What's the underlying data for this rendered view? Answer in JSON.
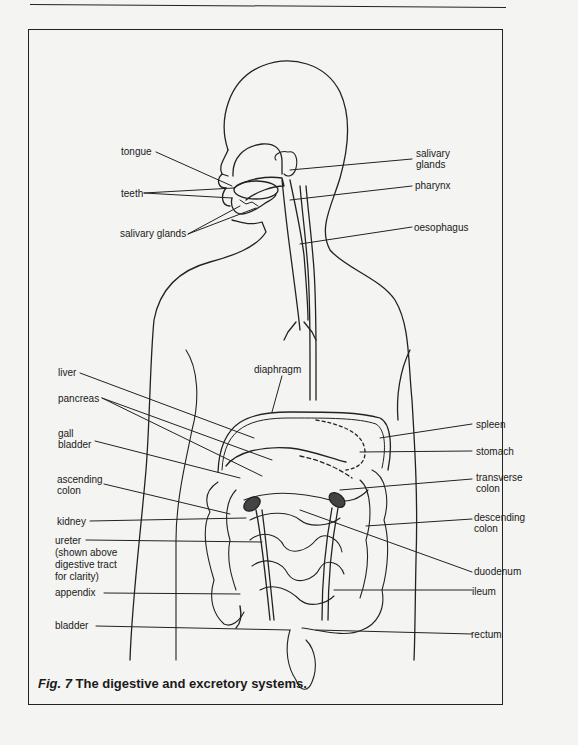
{
  "figure": {
    "caption_prefix": "Fig. 7",
    "caption_text": " The digestive and excretory systems."
  },
  "labels_left": {
    "tongue": "tongue",
    "teeth": "teeth",
    "salivary_glands_lower": "salivary glands",
    "liver": "liver",
    "pancreas": "pancreas",
    "gall_bladder_1": "gall",
    "gall_bladder_2": "bladder",
    "ascending_colon_1": "ascending",
    "ascending_colon_2": "colon",
    "kidney": "kidney",
    "ureter_1": "ureter",
    "ureter_2": "(shown above",
    "ureter_3": "digestive tract",
    "ureter_4": "for clarity)",
    "appendix": "appendix",
    "bladder": "bladder"
  },
  "labels_right": {
    "salivary_glands_upper_1": "salivary",
    "salivary_glands_upper_2": "glands",
    "pharynx": "pharynx",
    "oesophagus": "oesophagus",
    "spleen": "spleen",
    "stomach": "stomach",
    "transverse_colon_1": "transverse",
    "transverse_colon_2": "colon",
    "descending_colon_1": "descending",
    "descending_colon_2": "colon",
    "duodenum": "duodenum",
    "ileum": "ileum",
    "rectum": "rectum"
  },
  "labels_center": {
    "diaphragm": "diaphragm"
  }
}
